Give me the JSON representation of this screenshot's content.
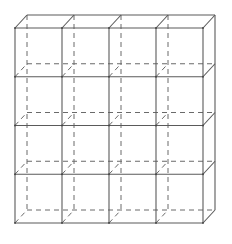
{
  "diagram": {
    "type": "wireframe-cube-grid",
    "rows": 4,
    "cols": 4,
    "front": {
      "x0": 15,
      "y0": 28,
      "x1": 203,
      "y1": 223
    },
    "depth_offset": {
      "dx": 12,
      "dy": -13
    },
    "colors": {
      "line": "#5a5a5a",
      "hidden_line": "#6a6a6a",
      "background": "#ffffff"
    }
  }
}
